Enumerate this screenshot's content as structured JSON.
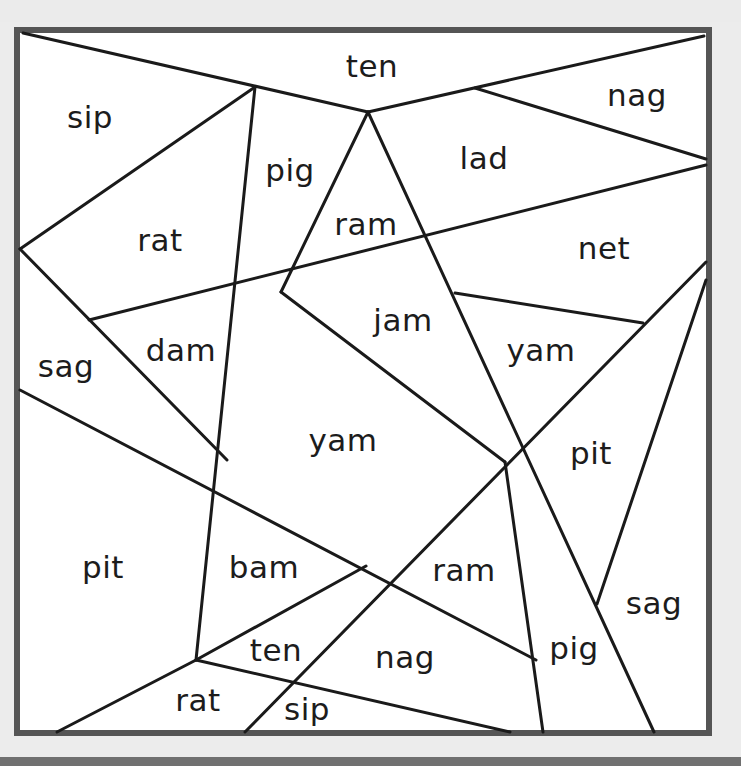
{
  "page": {
    "background": "#ececec",
    "frame_color": "#555555",
    "line_color": "#1a1a1a",
    "text_color": "#1c1c1c"
  },
  "puzzle": {
    "frame": {
      "x": 17,
      "y": 30,
      "width": 692,
      "height": 703
    },
    "lines": [
      [
        23,
        33,
        368,
        112
      ],
      [
        368,
        112,
        704,
        36
      ],
      [
        475,
        88,
        706,
        159
      ],
      [
        255,
        87,
        20,
        249
      ],
      [
        255,
        87,
        196,
        660
      ],
      [
        368,
        112,
        281,
        292
      ],
      [
        368,
        112,
        654,
        732
      ],
      [
        89,
        320,
        706,
        165
      ],
      [
        20,
        249,
        227,
        460
      ],
      [
        281,
        292,
        505,
        462
      ],
      [
        455,
        293,
        643,
        323
      ],
      [
        706,
        262,
        245,
        732
      ],
      [
        706,
        280,
        597,
        604
      ],
      [
        505,
        462,
        543,
        732
      ],
      [
        20,
        390,
        536,
        660
      ],
      [
        196,
        660,
        366,
        566
      ],
      [
        196,
        660,
        510,
        732
      ],
      [
        196,
        660,
        57,
        732
      ]
    ],
    "regions": [
      {
        "label": "ten",
        "x": 372,
        "y": 66
      },
      {
        "label": "nag",
        "x": 637,
        "y": 95
      },
      {
        "label": "sip",
        "x": 90,
        "y": 117
      },
      {
        "label": "pig",
        "x": 290,
        "y": 170
      },
      {
        "label": "lad",
        "x": 484,
        "y": 158
      },
      {
        "label": "ram",
        "x": 366,
        "y": 224
      },
      {
        "label": "rat",
        "x": 160,
        "y": 240
      },
      {
        "label": "net",
        "x": 604,
        "y": 248
      },
      {
        "label": "jam",
        "x": 403,
        "y": 320
      },
      {
        "label": "dam",
        "x": 181,
        "y": 350
      },
      {
        "label": "sag",
        "x": 66,
        "y": 366
      },
      {
        "label": "yam",
        "x": 541,
        "y": 350
      },
      {
        "label": "yam",
        "x": 343,
        "y": 440
      },
      {
        "label": "pit",
        "x": 591,
        "y": 453
      },
      {
        "label": "pit",
        "x": 103,
        "y": 567
      },
      {
        "label": "bam",
        "x": 264,
        "y": 567
      },
      {
        "label": "ram",
        "x": 464,
        "y": 570
      },
      {
        "label": "sag",
        "x": 654,
        "y": 603
      },
      {
        "label": "ten",
        "x": 276,
        "y": 650
      },
      {
        "label": "nag",
        "x": 405,
        "y": 657
      },
      {
        "label": "pig",
        "x": 574,
        "y": 648
      },
      {
        "label": "rat",
        "x": 198,
        "y": 700
      },
      {
        "label": "sip",
        "x": 307,
        "y": 709
      }
    ]
  }
}
